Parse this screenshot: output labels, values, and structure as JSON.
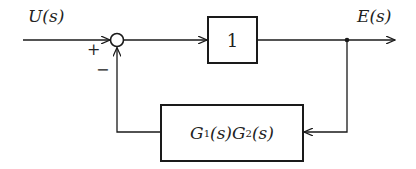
{
  "diagram": {
    "type": "feedback-block-diagram",
    "input_signal": "U(s)",
    "output_signal": "E(s)",
    "summing_junction": {
      "signs": {
        "input": "+",
        "feedback": "−"
      }
    },
    "forward_block": {
      "label": "1"
    },
    "feedback_block": {
      "label_parts": {
        "g1": "G",
        "g1_sub": "1",
        "arg1": "(s)",
        "g2": "G",
        "g2_sub": "2",
        "arg2": "(s)"
      },
      "label": "G1(s)G2(s)"
    },
    "colors": {
      "line": "#1a1a1a",
      "background": "#ffffff"
    }
  }
}
